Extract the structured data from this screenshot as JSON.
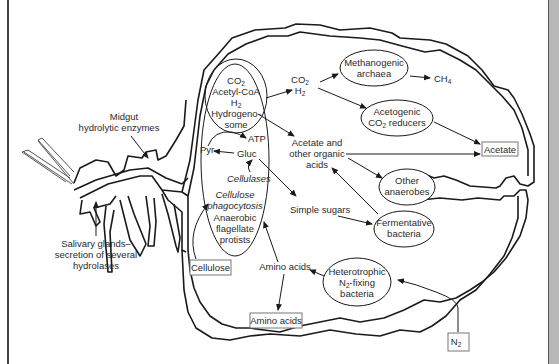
{
  "diagram": {
    "colors": {
      "line": "#1a1a1a",
      "text": "#2a2a2a",
      "box_border": "#777777",
      "right_bar": "#b8b8b8"
    },
    "termite_labels": {
      "midgut_line1": "Midgut",
      "midgut_line2": "hydrolytic enzymes",
      "salivary_line1": "Salivary glands–",
      "salivary_line2": "secretion of several",
      "salivary_line3": "hydrolases"
    },
    "protist": {
      "hydrogenosome": {
        "co2": "CO",
        "co2_sub": "2",
        "acetyl": "Acetyl-CoA",
        "h2": "H",
        "h2_sub": "2",
        "name_line1": "Hydrogeno-",
        "name_line2": "some"
      },
      "atp": "ATP",
      "pyr": "Pyr",
      "gluc": "Gluc",
      "cellulases": "Cellulases",
      "cellulose_phago_line1": "Cellulose",
      "cellulose_phago_line2": "phagocytosis",
      "name_line1": "Anaerobic",
      "name_line2": "flagellate",
      "name_line3": "protists"
    },
    "products": {
      "co2_h2": {
        "co2": "CO",
        "co2_sub": "2",
        "h2": "H",
        "h2_sub": "2"
      },
      "ch4": {
        "text": "CH",
        "sub": "4"
      },
      "acetate_organic_line1": "Acetate and",
      "acetate_organic_line2": "other organic",
      "acetate_organic_line3": "acids",
      "simple_sugars": "Simple sugars",
      "amino_acids": "Amino acids"
    },
    "organisms": {
      "methanogenic_line1": "Methanogenic",
      "methanogenic_line2": "archaea",
      "acetogenic_line1": "Acetogenic",
      "acetogenic_line2a": "CO",
      "acetogenic_line2_sub": "2",
      "acetogenic_line2b": " reducers",
      "other_line1": "Other",
      "other_line2": "anaerobes",
      "fermentative_line1": "Fermentative",
      "fermentative_line2": "bacteria",
      "heterotrophic_line1": "Heterotrophic",
      "heterotrophic_line2a": "N",
      "heterotrophic_line2_sub": "2",
      "heterotrophic_line2b": "-fixing",
      "heterotrophic_line3": "bacteria"
    },
    "boxes": {
      "acetate": "Acetate",
      "cellulose": "Cellulose",
      "amino_acids": "Amino acids",
      "n2": "N",
      "n2_sub": "2"
    }
  }
}
